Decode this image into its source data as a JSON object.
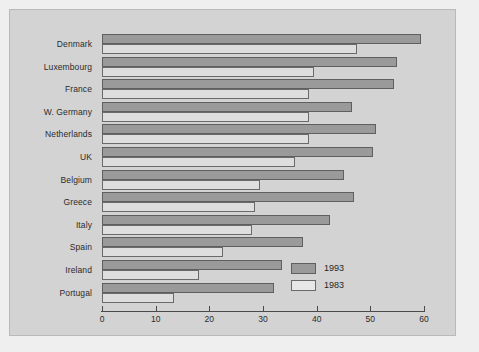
{
  "chart_data": {
    "type": "bar",
    "orientation": "horizontal",
    "title": "",
    "xlabel": "",
    "ylabel": "",
    "xlim": [
      0,
      60
    ],
    "xticks": [
      0,
      10,
      20,
      30,
      40,
      50,
      60
    ],
    "grid": false,
    "legend_position": "bottom-right",
    "categories": [
      "Denmark",
      "Luxembourg",
      "France",
      "W. Germany",
      "Netherlands",
      "UK",
      "Belgium",
      "Greece",
      "Italy",
      "Spain",
      "Ireland",
      "Portugal"
    ],
    "series": [
      {
        "name": "1993",
        "color": "#9a9a9a",
        "values": [
          59.5,
          55.0,
          54.5,
          46.5,
          51.0,
          50.5,
          45.0,
          47.0,
          42.5,
          37.5,
          33.5,
          32.0
        ]
      },
      {
        "name": "1983",
        "color": "#dedede",
        "values": [
          47.5,
          39.5,
          38.5,
          38.5,
          38.5,
          36.0,
          29.5,
          28.5,
          28.0,
          22.5,
          18.0,
          13.5
        ]
      }
    ]
  },
  "legend": {
    "items": [
      {
        "label": "1993",
        "swatch": "s1993"
      },
      {
        "label": "1983",
        "swatch": "s1983"
      }
    ]
  }
}
